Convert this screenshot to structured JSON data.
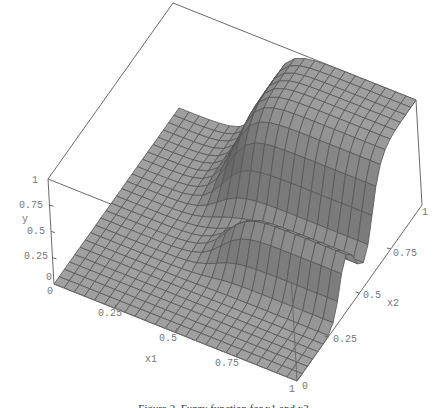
{
  "figure": {
    "caption": "Figure 2. Fuzzy function for x1 and x2",
    "colors": {
      "surface": "#9a9a9a",
      "surface_dark": "#6e6e6e",
      "mesh": "#4a4a4a",
      "box": "#6a6a6a",
      "labels": "#777777"
    }
  },
  "chart_data": {
    "type": "surface3d",
    "title": "",
    "axes": {
      "x1": {
        "label": "x1",
        "ticks": [
          "0",
          "0.25",
          "0.5",
          "0.75",
          "1"
        ],
        "range": [
          0,
          1
        ]
      },
      "x2": {
        "label": "x2",
        "ticks": [
          "0",
          "0.25",
          "0.5",
          "0.75",
          "1"
        ],
        "range": [
          0,
          1
        ]
      },
      "y": {
        "label": "y",
        "ticks": [
          "0",
          "0.25",
          "0.5",
          "0.75",
          "1"
        ],
        "range": [
          0,
          1
        ]
      }
    },
    "grid": true,
    "mesh_resolution": 24
  },
  "labels": {
    "y_ticks": [
      "0",
      "0.25",
      "0.5",
      "0.75",
      "1"
    ],
    "x1_ticks": [
      "0.25",
      "0.5",
      "0.75",
      "1"
    ],
    "x1_origin": "0",
    "x2_ticks": [
      "0",
      "0.25",
      "0.5",
      "0.75",
      "1"
    ],
    "y_title": "y",
    "x1_title": "x1",
    "x2_title": "x2"
  }
}
